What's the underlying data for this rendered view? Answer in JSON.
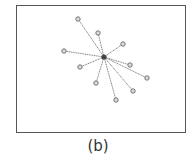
{
  "figure": {
    "caption": "(b)",
    "colors": {
      "frame": "#555555",
      "edge": "#777777",
      "node_stroke": "#666666",
      "node_fill": "#dddddd",
      "hub_fill": "#444444"
    },
    "hub": {
      "x": 104,
      "y": 57
    },
    "nodes": [
      {
        "x": 78,
        "y": 19
      },
      {
        "x": 98,
        "y": 33
      },
      {
        "x": 123,
        "y": 44
      },
      {
        "x": 64,
        "y": 51
      },
      {
        "x": 80,
        "y": 67
      },
      {
        "x": 130,
        "y": 65
      },
      {
        "x": 147,
        "y": 78
      },
      {
        "x": 96,
        "y": 83
      },
      {
        "x": 133,
        "y": 91
      },
      {
        "x": 116,
        "y": 100
      }
    ]
  }
}
